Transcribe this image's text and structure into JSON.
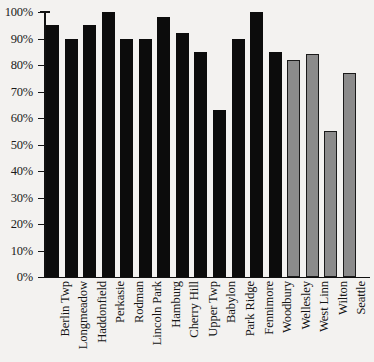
{
  "chart_data": {
    "type": "bar",
    "title": "",
    "subtitle": "",
    "xlabel": "",
    "ylabel": "",
    "ylim": [
      0,
      100
    ],
    "y_tick_labels": [
      "100%",
      "90%",
      "80%",
      "70%",
      "60%",
      "50%",
      "40%",
      "30%",
      "20%",
      "10%",
      "0%"
    ],
    "y_tick_values": [
      100,
      90,
      80,
      70,
      60,
      50,
      40,
      30,
      20,
      10,
      0
    ],
    "grid": false,
    "legend_position": "none",
    "value_suffix": "%",
    "categories": [
      "Berlin Twp",
      "Longmeadow",
      "Haddonfield",
      "Perkasie",
      "Rodman",
      "Lincoln Park",
      "Hamburg",
      "Cherry Hill",
      "Upper Twp",
      "Babylon",
      "Park Ridge",
      "Fennimore",
      "Woodbury",
      "Wellesley",
      "West Linn",
      "Wilton",
      "Seattle"
    ],
    "values": [
      95,
      90,
      95,
      100,
      90,
      90,
      98,
      92,
      85,
      63,
      90,
      100,
      85,
      82,
      84,
      55,
      77
    ],
    "bar_styles": [
      "black",
      "black",
      "black",
      "black",
      "black",
      "black",
      "black",
      "black",
      "black",
      "black",
      "black",
      "black",
      "black",
      "gray",
      "gray",
      "gray",
      "gray"
    ],
    "colors": {
      "bar_black": "#0c0c0c",
      "bar_gray": "#8b8b8b",
      "bar_gray_outline": "#1a1a1a",
      "axis": "#111111",
      "background": "#f3f2f0",
      "text": "#141414"
    }
  }
}
